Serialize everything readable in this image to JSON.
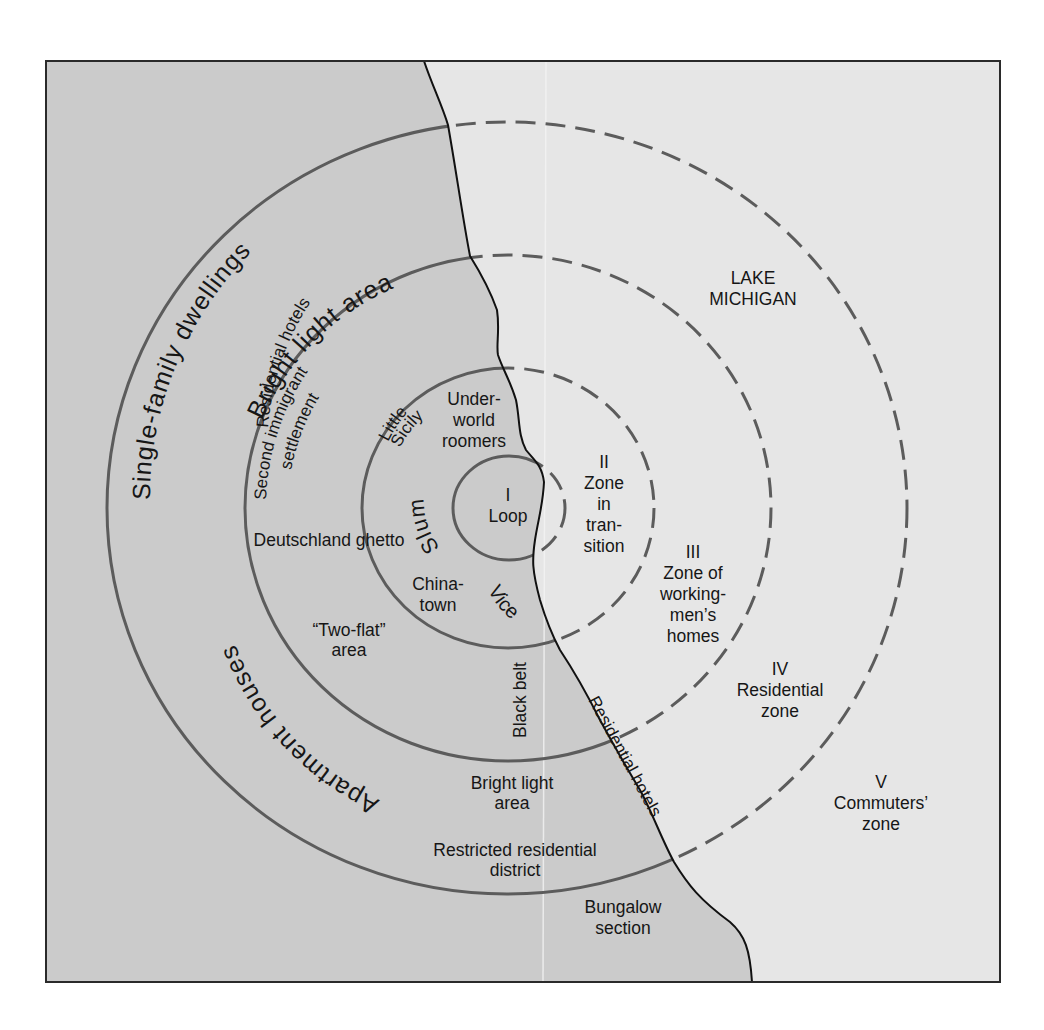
{
  "diagram": {
    "colors": {
      "land": "#cbcbcb",
      "lake": "#e6e6e6",
      "ring": "#5c5c5c",
      "shoreline": "#111111",
      "frame": "#2a2a2a",
      "text": "#161616"
    },
    "water_label": {
      "line1": "LAKE",
      "line2": "MICHIGAN"
    },
    "zones": [
      {
        "numeral": "I",
        "name": "Loop",
        "lines": [
          "I",
          "Loop"
        ]
      },
      {
        "numeral": "II",
        "name": "Zone in transition",
        "lines": [
          "II",
          "Zone",
          "in",
          "tran-",
          "sition"
        ]
      },
      {
        "numeral": "III",
        "name": "Zone of workingmen's homes",
        "lines": [
          "III",
          "Zone of",
          "working-",
          "men’s",
          "homes"
        ]
      },
      {
        "numeral": "IV",
        "name": "Residential zone",
        "lines": [
          "IV",
          "Residential",
          "zone"
        ]
      },
      {
        "numeral": "V",
        "name": "Commuters' zone",
        "lines": [
          "V",
          "Commuters’",
          "zone"
        ]
      }
    ],
    "neighborhoods": {
      "underworld": [
        "Under-",
        "world",
        "roomers"
      ],
      "little_sicily": [
        "Little",
        "Sicily"
      ],
      "slum": "Slum",
      "deutschland": "Deutschland ghetto",
      "chinatown": [
        "China-",
        "town"
      ],
      "vice": "Vice",
      "black_belt": "Black belt",
      "two_flat": [
        "“Two-flat”",
        "area"
      ],
      "second_immigrant": [
        "Second immigrant",
        "settlement"
      ],
      "bright_light_upper": "Bright light area",
      "residential_hotels_upper": "Residential hotels",
      "single_family": "Single-family  dwellings",
      "apartment_houses": "Apartment       houses",
      "bright_light_lower": [
        "Bright light",
        "area"
      ],
      "restricted": [
        "Restricted residential",
        "district"
      ],
      "residential_hotels_shore": "Residential hotels",
      "bungalow": [
        "Bungalow",
        "section"
      ]
    }
  }
}
